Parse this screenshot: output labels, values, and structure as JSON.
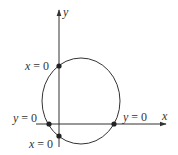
{
  "diagram": {
    "axes": {
      "x_label": "x",
      "y_label": "y"
    },
    "intercepts": {
      "top_x0": {
        "var": "x",
        "eq": " = ",
        "val": "0"
      },
      "left_y0": {
        "var": "y",
        "eq": " = ",
        "val": "0"
      },
      "right_y0": {
        "var": "y",
        "eq": " = ",
        "val": "0"
      },
      "bottom_x0": {
        "var": "x",
        "eq": " = ",
        "val": "0"
      }
    },
    "colors": {
      "stroke": "#333333",
      "point": "#222222",
      "background": "#ffffff"
    }
  }
}
